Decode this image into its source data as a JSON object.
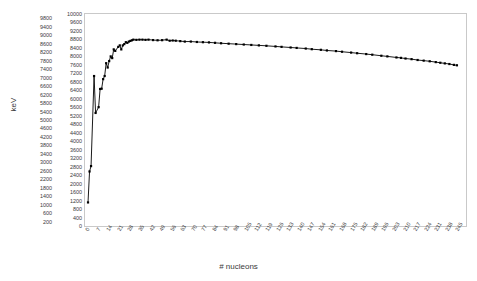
{
  "chart_data": {
    "type": "line",
    "title": "",
    "xlabel": "# nucleons",
    "ylabel": "keV",
    "xlim": [
      0,
      252
    ],
    "ylim": [
      0,
      10000
    ],
    "grid": false,
    "legend": null,
    "marker": "square",
    "line_color": "#000000",
    "marker_color": "#000000",
    "frame_color": "#c9c9c9",
    "x_tick_step": 7,
    "y_tick_step": 200,
    "y_tick_labels": [
      10000,
      9800,
      9600,
      9400,
      9200,
      9000,
      8800,
      8600,
      8400,
      8200,
      8000,
      7800,
      7600,
      7400,
      7200,
      7000,
      6800,
      6600,
      6400,
      6200,
      6000,
      5800,
      5600,
      5400,
      5200,
      5000,
      4800,
      4600,
      4400,
      4200,
      4000,
      3800,
      3600,
      3400,
      3200,
      3000,
      2800,
      2600,
      2400,
      2200,
      2000,
      1800,
      1600,
      1400,
      1200,
      1000,
      800,
      600,
      400,
      200,
      0
    ],
    "x_tick_labels": [
      0,
      7,
      14,
      21,
      28,
      35,
      42,
      49,
      56,
      63,
      70,
      77,
      84,
      91,
      98,
      105,
      112,
      119,
      126,
      133,
      140,
      147,
      154,
      161,
      168,
      175,
      182,
      189,
      196,
      203,
      210,
      217,
      224,
      231,
      238,
      245
    ],
    "series_name": "binding energy per nucleon",
    "x": [
      2,
      3,
      4,
      6,
      7,
      9,
      10,
      11,
      12,
      13,
      14,
      15,
      16,
      17,
      18,
      19,
      20,
      22,
      23,
      24,
      25,
      26,
      27,
      28,
      29,
      30,
      31,
      32,
      34,
      36,
      38,
      40,
      42,
      45,
      48,
      51,
      54,
      56,
      58,
      60,
      63,
      66,
      70,
      74,
      78,
      82,
      86,
      90,
      95,
      100,
      105,
      110,
      115,
      120,
      126,
      130,
      136,
      140,
      146,
      150,
      156,
      160,
      166,
      170,
      176,
      180,
      186,
      190,
      196,
      200,
      206,
      209,
      212,
      216,
      220,
      224,
      228,
      232,
      235,
      238,
      241,
      244,
      246
    ],
    "y": [
      1112,
      2572,
      2827,
      7074,
      5332,
      5606,
      6463,
      6476,
      6928,
      7074,
      7680,
      7475,
      7780,
      8000,
      7920,
      8330,
      8260,
      8450,
      8520,
      8330,
      8520,
      8580,
      8670,
      8640,
      8700,
      8730,
      8760,
      8790,
      8780,
      8790,
      8790,
      8780,
      8790,
      8770,
      8760,
      8765,
      8790,
      8740,
      8750,
      8740,
      8720,
      8700,
      8700,
      8680,
      8670,
      8660,
      8640,
      8620,
      8600,
      8580,
      8560,
      8540,
      8520,
      8500,
      8470,
      8450,
      8420,
      8400,
      8370,
      8340,
      8310,
      8280,
      8250,
      8220,
      8180,
      8150,
      8110,
      8080,
      8030,
      8000,
      7950,
      7930,
      7900,
      7870,
      7830,
      7800,
      7770,
      7730,
      7700,
      7670,
      7640,
      7600,
      7580
    ]
  }
}
